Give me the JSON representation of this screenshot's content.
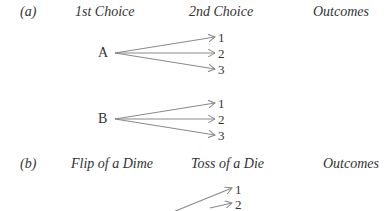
{
  "figure": {
    "part_a": {
      "label": "(a)",
      "headers": [
        "1st Choice",
        "2nd Choice",
        "Outcomes"
      ],
      "branches": [
        {
          "root": "A",
          "leaves": [
            "1",
            "2",
            "3"
          ]
        },
        {
          "root": "B",
          "leaves": [
            "1",
            "2",
            "3"
          ]
        }
      ]
    },
    "part_b": {
      "label": "(b)",
      "headers": [
        "Flip of a Dime",
        "Toss of a Die",
        "Outcomes"
      ],
      "leaves_visible": [
        "1",
        "2"
      ]
    },
    "arrow_color": "#8a8a8a"
  }
}
